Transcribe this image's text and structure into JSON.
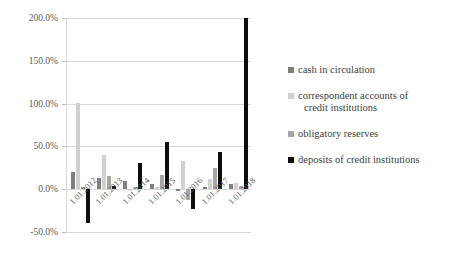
{
  "chart_data": {
    "type": "bar",
    "title": "",
    "xlabel": "",
    "ylabel": "",
    "categories": [
      "1.01.2012",
      "1.01.2013",
      "1.01.2014",
      "1.01.2015",
      "1.01.2016",
      "1.01.2017",
      "1.01.2018"
    ],
    "ylim": [
      -50,
      200
    ],
    "ytick_labels": [
      "200.0%",
      "150.0%",
      "100.0%",
      "50.0%",
      "0.0%",
      "-50.0%"
    ],
    "ytick_values": [
      200,
      150,
      100,
      50,
      0,
      -50
    ],
    "grid": true,
    "legend_position": "right",
    "series": [
      {
        "name": "cash in circulation",
        "color": "#7f7f7f",
        "values": [
          20,
          13,
          10,
          6,
          -2,
          3,
          6
        ]
      },
      {
        "name": "correspondent accounts of credit institutions",
        "color": "#d0d0d0",
        "values": [
          101,
          40,
          -2,
          3,
          33,
          12,
          7
        ]
      },
      {
        "name": "obligatory reserves",
        "color": "#a6a6a6",
        "values": [
          3,
          16,
          2,
          17,
          -13,
          25,
          4
        ]
      },
      {
        "name": "deposits of credit institutions",
        "color": "#0d0d0d",
        "values": [
          -40,
          4,
          31,
          55,
          -23,
          43,
          200
        ]
      }
    ]
  },
  "legend": {
    "items": [
      {
        "label": "cash in circulation",
        "continuation": ""
      },
      {
        "label": "correspondent accounts of",
        "continuation": "credit institutions"
      },
      {
        "label": "obligatory reserves",
        "continuation": ""
      },
      {
        "label": "deposits of credit institutions",
        "continuation": ""
      }
    ]
  }
}
